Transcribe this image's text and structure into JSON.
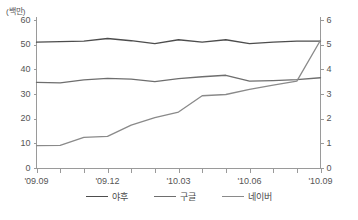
{
  "chart_data": {
    "type": "line",
    "title": "",
    "subtitle": "",
    "unit_label": "(백만)",
    "xlabel": "",
    "ylabel": "",
    "grid": false,
    "legend_position": "bottom",
    "x": [
      "'09.09",
      "'09.10",
      "'09.11",
      "'09.12",
      "'10.01",
      "'10.02",
      "'10.03",
      "'10.04",
      "'10.05",
      "'10.06",
      "'10.07",
      "'10.08",
      "'10.09"
    ],
    "x_tick_labels": [
      "'09.09",
      "'09.12",
      "'10.03",
      "'10.06",
      "'10.09"
    ],
    "x_tick_indices": [
      0,
      3,
      6,
      9,
      12
    ],
    "y_left": {
      "ticks": [
        0,
        10,
        20,
        30,
        40,
        50,
        60
      ],
      "ylim": [
        0,
        60
      ],
      "label": "(백만)"
    },
    "y_right": {
      "ticks": [
        0,
        1,
        2,
        3,
        4,
        5,
        6
      ],
      "ylim": [
        0,
        6
      ],
      "label": ""
    },
    "series": [
      {
        "name": "야후",
        "axis": "left",
        "color": "#4d4d4d",
        "values": [
          51.2,
          51.4,
          51.6,
          52.7,
          51.8,
          50.6,
          52.2,
          51.2,
          52.2,
          50.6,
          51.2,
          51.6,
          51.6
        ]
      },
      {
        "name": "구글",
        "axis": "left",
        "color": "#6e6e6e",
        "values": [
          34.9,
          34.7,
          35.9,
          36.5,
          36.2,
          35.2,
          36.4,
          37.2,
          37.8,
          35.4,
          35.6,
          36.0,
          36.8
        ]
      },
      {
        "name": "네이버",
        "axis": "left",
        "color": "#8a8a8a",
        "values": [
          9.3,
          9.4,
          12.6,
          13.0,
          17.6,
          20.6,
          22.9,
          29.5,
          30.0,
          32.1,
          33.8,
          35.4,
          52.0
        ]
      }
    ]
  },
  "legend": {
    "items": [
      {
        "label": "야후",
        "color": "#4d4d4d"
      },
      {
        "label": "구글",
        "color": "#6e6e6e"
      },
      {
        "label": "네이버",
        "color": "#8a8a8a"
      }
    ]
  }
}
